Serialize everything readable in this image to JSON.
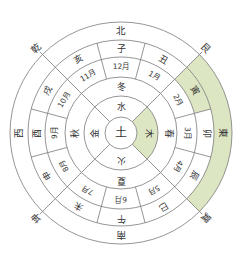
{
  "diagram": {
    "type": "concentric-wheel",
    "center": [
      121,
      133
    ],
    "radii": [
      16,
      37,
      56,
      76,
      93,
      111
    ],
    "colors": {
      "highlight": "#dde6c2",
      "line": "#7a7a7a",
      "text": "#333333"
    },
    "center_label": "土",
    "elements": [
      {
        "label": "水",
        "angle": 0
      },
      {
        "label": "木",
        "angle": 90,
        "highlight": true
      },
      {
        "label": "火",
        "angle": 180
      },
      {
        "label": "金",
        "angle": 270
      }
    ],
    "seasons": [
      {
        "label": "冬",
        "angle": 0
      },
      {
        "label": "春",
        "angle": 90
      },
      {
        "label": "夏",
        "angle": 180
      },
      {
        "label": "秋",
        "angle": 270
      }
    ],
    "months": [
      {
        "label": "12月",
        "angle": 0
      },
      {
        "label": "1月",
        "angle": 30
      },
      {
        "label": "2月",
        "angle": 60
      },
      {
        "label": "3月",
        "angle": 90
      },
      {
        "label": "4月",
        "angle": 120
      },
      {
        "label": "5月",
        "angle": 150
      },
      {
        "label": "6月",
        "angle": 180
      },
      {
        "label": "7月",
        "angle": 210
      },
      {
        "label": "8月",
        "angle": 240
      },
      {
        "label": "9月",
        "angle": 270
      },
      {
        "label": "10月",
        "angle": 300
      },
      {
        "label": "11月",
        "angle": 330
      }
    ],
    "branches": [
      {
        "label": "子",
        "angle": 0
      },
      {
        "label": "丑",
        "angle": 30
      },
      {
        "label": "寅",
        "angle": 60,
        "highlight": true
      },
      {
        "label": "卯",
        "angle": 90
      },
      {
        "label": "辰",
        "angle": 120
      },
      {
        "label": "巳",
        "angle": 150
      },
      {
        "label": "午",
        "angle": 180
      },
      {
        "label": "未",
        "angle": 210
      },
      {
        "label": "申",
        "angle": 240
      },
      {
        "label": "酉",
        "angle": 270
      },
      {
        "label": "戌",
        "angle": 300
      },
      {
        "label": "亥",
        "angle": 330
      }
    ],
    "directions": [
      {
        "label": "北",
        "angle": 0
      },
      {
        "label": "東",
        "angle": 90
      },
      {
        "label": "南",
        "angle": 180
      },
      {
        "label": "西",
        "angle": 270
      }
    ],
    "outer_highlight": {
      "start": 45,
      "end": 135
    },
    "corner_labels": [
      {
        "label": "艮",
        "angle": 45
      },
      {
        "label": "巽",
        "angle": 135
      },
      {
        "label": "坤",
        "angle": 225
      },
      {
        "label": "乾",
        "angle": 315
      }
    ]
  }
}
